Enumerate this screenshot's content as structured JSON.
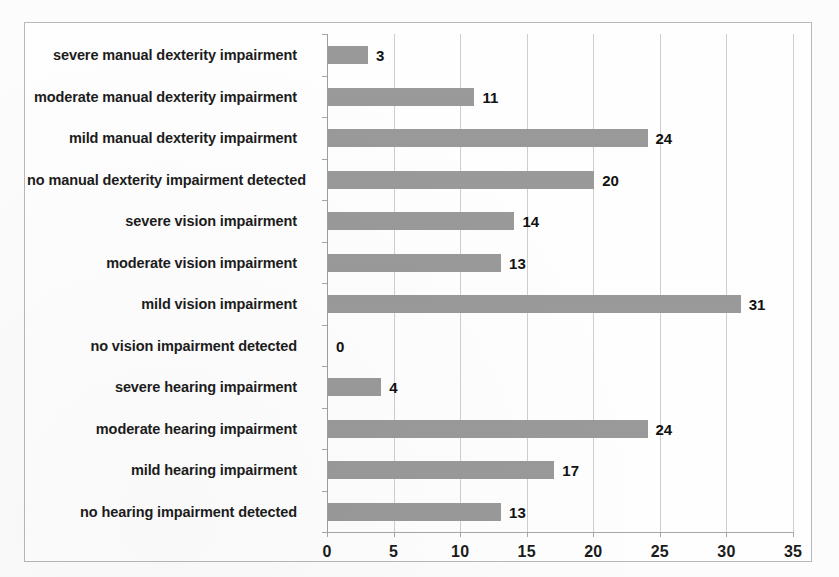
{
  "chart_data": {
    "type": "bar",
    "orientation": "horizontal",
    "title": "",
    "xlabel": "",
    "ylabel": "",
    "xlim": [
      0,
      35
    ],
    "xticks": [
      0,
      5,
      10,
      15,
      20,
      25,
      30,
      35
    ],
    "grid": true,
    "legend": false,
    "bar_color": "#9a9a9a",
    "categories": [
      "severe manual  dexterity impairment",
      "moderate manual  dexterity impairment",
      "mild manual  dexterity impairment",
      "no manual dexterity impairment detected",
      "severe vision impairment",
      "moderate vision impairment",
      "mild vision impairment",
      "no vision impairment detected",
      "severe hearing impairment",
      "moderate hearing impairment",
      "mild hearing impairment",
      "no hearing impairment detected"
    ],
    "values": [
      3,
      11,
      24,
      20,
      14,
      13,
      31,
      0,
      4,
      24,
      17,
      13
    ],
    "value_labels": [
      "3",
      "11",
      "24",
      "20",
      "14",
      "13",
      "31",
      "0",
      "4",
      "24",
      "17",
      "13"
    ]
  },
  "axis": {
    "tick_labels": [
      "0",
      "5",
      "10",
      "15",
      "20",
      "25",
      "30",
      "35"
    ]
  }
}
